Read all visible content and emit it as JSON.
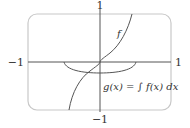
{
  "figure": {
    "axis_labels": {
      "x_min": "−1",
      "x_max": "1",
      "y_min": "−1",
      "y_max": "1"
    },
    "curve_f_label": "f",
    "curve_g_label": "g(x) = ∫ f(x) dx",
    "colors": {
      "frame": "#c8c8c8",
      "axes": "#555555",
      "curves": "#555555",
      "text": "#333333"
    }
  }
}
